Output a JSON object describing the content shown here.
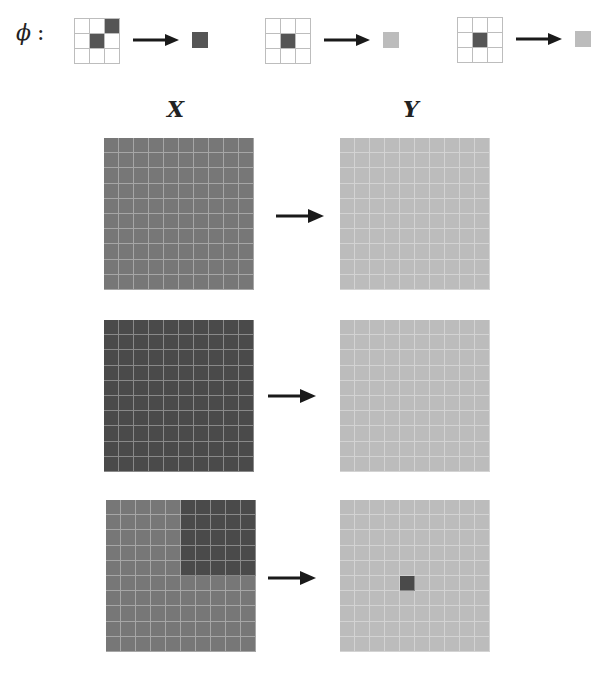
{
  "figure": {
    "phi_symbol": "ϕ",
    "phi_colon": ":",
    "x_label": "X",
    "y_label": "Y"
  },
  "colors": {
    "empty": "#ffffff",
    "dark": "#555555",
    "medium": "#777777",
    "darker": "#4a4a4a",
    "light": "#bcbcbc",
    "arrow": "#1a1a1a"
  },
  "rules": [
    {
      "pattern": [
        [
          0,
          0,
          1
        ],
        [
          0,
          1,
          0
        ],
        [
          0,
          0,
          0
        ]
      ],
      "output": "dark"
    },
    {
      "pattern": [
        [
          0,
          0,
          0
        ],
        [
          0,
          1,
          0
        ],
        [
          0,
          0,
          0
        ]
      ],
      "output": "light"
    },
    {
      "pattern": [
        [
          0,
          0,
          0
        ],
        [
          0,
          1,
          0
        ],
        [
          0,
          0,
          0
        ]
      ],
      "output": "light"
    }
  ],
  "examples": [
    {
      "x_grid": {
        "base": "medium",
        "overrides": []
      },
      "y_grid": {
        "base": "light",
        "overrides": []
      }
    },
    {
      "x_grid": {
        "base": "darker",
        "overrides": []
      },
      "y_grid": {
        "base": "light",
        "overrides": []
      }
    },
    {
      "x_grid": {
        "base": "medium",
        "overrides": [
          {
            "rows": [
              0,
              4
            ],
            "cols": [
              5,
              9
            ],
            "color": "darker"
          }
        ]
      },
      "y_grid": {
        "base": "light",
        "overrides": [
          {
            "rows": [
              5,
              5
            ],
            "cols": [
              4,
              4
            ],
            "color": "darker"
          }
        ]
      }
    }
  ]
}
